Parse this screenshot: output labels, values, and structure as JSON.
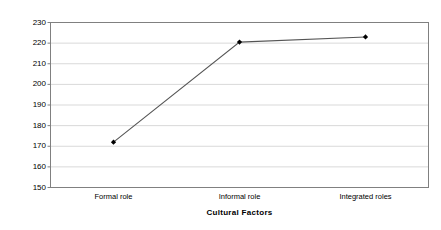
{
  "chart_data": {
    "type": "line",
    "title": "",
    "xlabel": "Cultural Factors",
    "ylabel": "Percent change",
    "categories": [
      "Formal role",
      "Informal role",
      "Integrated roles"
    ],
    "values": [
      172,
      220.5,
      223
    ],
    "series": [
      {
        "name": "Percent change",
        "values": [
          172,
          220.5,
          223
        ]
      }
    ],
    "ylim": [
      150,
      230
    ],
    "yticks": [
      150,
      160,
      170,
      180,
      190,
      200,
      210,
      220,
      230
    ],
    "ytick_labels": [
      "150",
      "160",
      "170",
      "180",
      "190",
      "200",
      "210",
      "220",
      "230"
    ],
    "grid": "horizontal",
    "legend": "none",
    "colors": {
      "line": "#555555",
      "marker": "#000000",
      "gridline": "#d9d9d9",
      "border": "#808080",
      "background": "#ffffff",
      "text": "#000000"
    }
  }
}
